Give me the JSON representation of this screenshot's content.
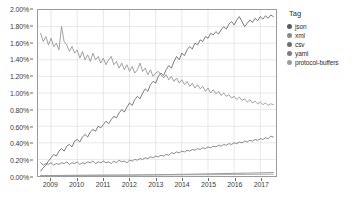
{
  "chart_data": {
    "type": "line",
    "title": "",
    "xlabel": "",
    "ylabel": "",
    "xlim": [
      2008.5,
      2017.6
    ],
    "ylim": [
      0.0,
      2.0
    ],
    "grid": true,
    "legend_position": "right",
    "legend_title": "Tag",
    "y_tick_labels": [
      "0.00%",
      "0.20%",
      "0.40%",
      "0.60%",
      "0.80%",
      "1.00%",
      "1.20%",
      "1.40%",
      "1.60%",
      "1.80%",
      "2.00%"
    ],
    "y_tick_values": [
      0.0,
      0.2,
      0.4,
      0.6,
      0.8,
      1.0,
      1.2,
      1.4,
      1.6,
      1.8,
      2.0
    ],
    "x_tick_labels": [
      "2009",
      "2010",
      "2011",
      "2012",
      "2013",
      "2014",
      "2015",
      "2016",
      "2017"
    ],
    "x_tick_values": [
      2009,
      2010,
      2011,
      2012,
      2013,
      2014,
      2015,
      2016,
      2017
    ],
    "series": [
      {
        "name": "json",
        "color": "#5b5b5b",
        "x": [
          2008.6,
          2008.7,
          2008.8,
          2008.9,
          2009.0,
          2009.1,
          2009.2,
          2009.3,
          2009.4,
          2009.5,
          2009.6,
          2009.7,
          2009.8,
          2009.9,
          2010.0,
          2010.1,
          2010.2,
          2010.3,
          2010.4,
          2010.5,
          2010.6,
          2010.7,
          2010.8,
          2010.9,
          2011.0,
          2011.1,
          2011.2,
          2011.3,
          2011.4,
          2011.5,
          2011.6,
          2011.7,
          2011.8,
          2011.9,
          2012.0,
          2012.1,
          2012.2,
          2012.3,
          2012.4,
          2012.5,
          2012.6,
          2012.7,
          2012.8,
          2012.9,
          2013.0,
          2013.1,
          2013.2,
          2013.3,
          2013.4,
          2013.5,
          2013.6,
          2013.7,
          2013.8,
          2013.9,
          2014.0,
          2014.1,
          2014.2,
          2014.3,
          2014.4,
          2014.5,
          2014.6,
          2014.7,
          2014.8,
          2014.9,
          2015.0,
          2015.1,
          2015.2,
          2015.3,
          2015.4,
          2015.5,
          2015.6,
          2015.7,
          2015.8,
          2015.9,
          2016.0,
          2016.1,
          2016.2,
          2016.3,
          2016.4,
          2016.5,
          2016.6,
          2016.7,
          2016.8,
          2016.9,
          2017.0,
          2017.1,
          2017.2,
          2017.3,
          2017.4,
          2017.5
        ],
        "values": [
          0.06,
          0.1,
          0.13,
          0.18,
          0.22,
          0.26,
          0.24,
          0.3,
          0.33,
          0.3,
          0.36,
          0.38,
          0.35,
          0.42,
          0.44,
          0.41,
          0.47,
          0.5,
          0.47,
          0.53,
          0.56,
          0.54,
          0.6,
          0.58,
          0.62,
          0.66,
          0.63,
          0.68,
          0.72,
          0.7,
          0.76,
          0.8,
          0.77,
          0.83,
          0.88,
          0.85,
          0.92,
          0.96,
          0.93,
          1.0,
          1.05,
          1.02,
          1.1,
          1.14,
          1.12,
          1.2,
          1.24,
          1.21,
          1.28,
          1.33,
          1.3,
          1.38,
          1.44,
          1.4,
          1.48,
          1.45,
          1.52,
          1.56,
          1.53,
          1.6,
          1.58,
          1.64,
          1.62,
          1.68,
          1.66,
          1.72,
          1.7,
          1.74,
          1.71,
          1.76,
          1.8,
          1.77,
          1.83,
          1.86,
          1.82,
          1.88,
          1.92,
          1.86,
          1.8,
          1.84,
          1.88,
          1.85,
          1.9,
          1.87,
          1.92,
          1.89,
          1.93,
          1.9,
          1.94,
          1.92
        ]
      },
      {
        "name": "xml",
        "color": "#8a8a8a",
        "x": [
          2008.6,
          2008.7,
          2008.8,
          2008.9,
          2009.0,
          2009.1,
          2009.2,
          2009.3,
          2009.4,
          2009.5,
          2009.6,
          2009.7,
          2009.8,
          2009.9,
          2010.0,
          2010.1,
          2010.2,
          2010.3,
          2010.4,
          2010.5,
          2010.6,
          2010.7,
          2010.8,
          2010.9,
          2011.0,
          2011.1,
          2011.2,
          2011.3,
          2011.4,
          2011.5,
          2011.6,
          2011.7,
          2011.8,
          2011.9,
          2012.0,
          2012.1,
          2012.2,
          2012.3,
          2012.4,
          2012.5,
          2012.6,
          2012.7,
          2012.8,
          2012.9,
          2013.0,
          2013.1,
          2013.2,
          2013.3,
          2013.4,
          2013.5,
          2013.6,
          2013.7,
          2013.8,
          2013.9,
          2014.0,
          2014.1,
          2014.2,
          2014.3,
          2014.4,
          2014.5,
          2014.6,
          2014.7,
          2014.8,
          2014.9,
          2015.0,
          2015.1,
          2015.2,
          2015.3,
          2015.4,
          2015.5,
          2015.6,
          2015.7,
          2015.8,
          2015.9,
          2016.0,
          2016.1,
          2016.2,
          2016.3,
          2016.4,
          2016.5,
          2016.6,
          2016.7,
          2016.8,
          2016.9,
          2017.0,
          2017.1,
          2017.2,
          2017.3,
          2017.4,
          2017.5
        ],
        "values": [
          1.72,
          1.62,
          1.68,
          1.58,
          1.66,
          1.56,
          1.6,
          1.52,
          1.8,
          1.62,
          1.58,
          1.5,
          1.56,
          1.48,
          1.52,
          1.42,
          1.5,
          1.4,
          1.46,
          1.38,
          1.48,
          1.4,
          1.44,
          1.36,
          1.42,
          1.34,
          1.4,
          1.44,
          1.34,
          1.38,
          1.3,
          1.36,
          1.28,
          1.34,
          1.26,
          1.32,
          1.24,
          1.28,
          1.36,
          1.26,
          1.3,
          1.22,
          1.28,
          1.2,
          1.24,
          1.26,
          1.22,
          1.18,
          1.22,
          1.16,
          1.2,
          1.14,
          1.18,
          1.12,
          1.16,
          1.1,
          1.14,
          1.08,
          1.12,
          1.06,
          1.1,
          1.05,
          1.08,
          1.02,
          1.06,
          1.0,
          1.04,
          0.99,
          1.02,
          0.97,
          1.0,
          0.96,
          0.98,
          0.94,
          0.96,
          0.92,
          0.95,
          0.91,
          0.93,
          0.89,
          0.92,
          0.88,
          0.9,
          0.87,
          0.89,
          0.86,
          0.88,
          0.85,
          0.87,
          0.86
        ]
      },
      {
        "name": "csv",
        "color": "#6f6f6f",
        "x": [
          2008.6,
          2008.7,
          2008.8,
          2008.9,
          2009.0,
          2009.1,
          2009.2,
          2009.3,
          2009.4,
          2009.5,
          2009.6,
          2009.7,
          2009.8,
          2009.9,
          2010.0,
          2010.1,
          2010.2,
          2010.3,
          2010.4,
          2010.5,
          2010.6,
          2010.7,
          2010.8,
          2010.9,
          2011.0,
          2011.1,
          2011.2,
          2011.3,
          2011.4,
          2011.5,
          2011.6,
          2011.7,
          2011.8,
          2011.9,
          2012.0,
          2012.1,
          2012.2,
          2012.3,
          2012.4,
          2012.5,
          2012.6,
          2012.7,
          2012.8,
          2012.9,
          2013.0,
          2013.1,
          2013.2,
          2013.3,
          2013.4,
          2013.5,
          2013.6,
          2013.7,
          2013.8,
          2013.9,
          2014.0,
          2014.1,
          2014.2,
          2014.3,
          2014.4,
          2014.5,
          2014.6,
          2014.7,
          2014.8,
          2014.9,
          2015.0,
          2015.1,
          2015.2,
          2015.3,
          2015.4,
          2015.5,
          2015.6,
          2015.7,
          2015.8,
          2015.9,
          2016.0,
          2016.1,
          2016.2,
          2016.3,
          2016.4,
          2016.5,
          2016.6,
          2016.7,
          2016.8,
          2016.9,
          2017.0,
          2017.1,
          2017.2,
          2017.3,
          2017.4,
          2017.5
        ],
        "values": [
          0.16,
          0.13,
          0.15,
          0.14,
          0.16,
          0.13,
          0.15,
          0.14,
          0.16,
          0.15,
          0.17,
          0.14,
          0.16,
          0.15,
          0.17,
          0.14,
          0.16,
          0.15,
          0.17,
          0.16,
          0.18,
          0.15,
          0.17,
          0.16,
          0.18,
          0.16,
          0.17,
          0.15,
          0.18,
          0.16,
          0.19,
          0.17,
          0.18,
          0.16,
          0.19,
          0.18,
          0.2,
          0.19,
          0.21,
          0.2,
          0.22,
          0.21,
          0.23,
          0.22,
          0.24,
          0.23,
          0.25,
          0.24,
          0.26,
          0.25,
          0.28,
          0.27,
          0.29,
          0.28,
          0.3,
          0.29,
          0.31,
          0.3,
          0.32,
          0.31,
          0.33,
          0.32,
          0.34,
          0.33,
          0.35,
          0.34,
          0.36,
          0.35,
          0.37,
          0.36,
          0.38,
          0.37,
          0.39,
          0.38,
          0.4,
          0.39,
          0.41,
          0.4,
          0.42,
          0.41,
          0.43,
          0.42,
          0.44,
          0.43,
          0.45,
          0.44,
          0.46,
          0.45,
          0.48,
          0.47
        ]
      },
      {
        "name": "yaml",
        "color": "#7d7d7d",
        "x": [
          2008.6,
          2009.0,
          2009.5,
          2010.0,
          2010.5,
          2011.0,
          2011.5,
          2012.0,
          2012.5,
          2013.0,
          2013.5,
          2014.0,
          2014.5,
          2015.0,
          2015.5,
          2016.0,
          2016.5,
          2017.0,
          2017.5
        ],
        "values": [
          0.005,
          0.006,
          0.007,
          0.008,
          0.009,
          0.01,
          0.011,
          0.012,
          0.014,
          0.016,
          0.018,
          0.02,
          0.023,
          0.026,
          0.029,
          0.032,
          0.035,
          0.038,
          0.041
        ]
      },
      {
        "name": "protocol-buffers",
        "color": "#9c9c9c",
        "x": [
          2008.6,
          2009.0,
          2009.5,
          2010.0,
          2010.5,
          2011.0,
          2011.5,
          2012.0,
          2012.5,
          2013.0,
          2013.5,
          2014.0,
          2014.5,
          2015.0,
          2015.5,
          2016.0,
          2016.5,
          2017.0,
          2017.5
        ],
        "values": [
          0.004,
          0.005,
          0.006,
          0.007,
          0.008,
          0.009,
          0.009,
          0.01,
          0.011,
          0.012,
          0.013,
          0.014,
          0.015,
          0.016,
          0.017,
          0.018,
          0.019,
          0.02,
          0.021
        ]
      }
    ]
  },
  "legend": {
    "title": "Tag",
    "items": [
      {
        "label": "json",
        "color": "#5b5b5b"
      },
      {
        "label": "xml",
        "color": "#8a8a8a"
      },
      {
        "label": "csv",
        "color": "#6f6f6f"
      },
      {
        "label": "yaml",
        "color": "#7d7d7d"
      },
      {
        "label": "protocol-buffers",
        "color": "#9c9c9c"
      }
    ]
  }
}
